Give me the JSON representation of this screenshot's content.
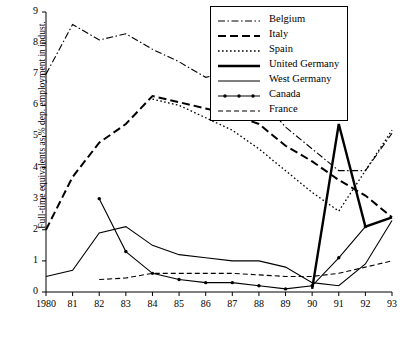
{
  "chart_data": {
    "type": "line",
    "title": "",
    "xlabel": "",
    "ylabel": "Full-time equivalents as % dep. employment in indust.",
    "x": [
      "1980",
      "81",
      "82",
      "83",
      "84",
      "85",
      "86",
      "87",
      "88",
      "89",
      "90",
      "91",
      "92",
      "93"
    ],
    "xtick_labels": [
      "1980",
      "81",
      "82",
      "83",
      "84",
      "85",
      "86",
      "87",
      "88",
      "89",
      "90",
      "91",
      "92",
      "93"
    ],
    "ytick_labels": [
      "0",
      "1",
      "2",
      "3",
      "4",
      "5",
      "6",
      "7",
      "8",
      "9"
    ],
    "ylim": [
      0,
      9
    ],
    "xlim": [
      1980,
      1993
    ],
    "grid": false,
    "legend_position": "top-right",
    "series": [
      {
        "name": "Belgium",
        "style": "dash-dot",
        "values": [
          7.0,
          8.6,
          8.1,
          8.3,
          7.8,
          7.4,
          6.9,
          7.1,
          6.3,
          5.3,
          4.6,
          3.9,
          3.9,
          5.1
        ]
      },
      {
        "name": "Italy",
        "style": "dashed-thick",
        "values": [
          2.0,
          3.7,
          4.8,
          5.4,
          6.3,
          6.1,
          5.9,
          5.7,
          5.4,
          4.7,
          4.2,
          3.6,
          3.1,
          2.4
        ]
      },
      {
        "name": "Spain",
        "style": "dotted",
        "values": [
          null,
          null,
          null,
          null,
          6.2,
          6.0,
          5.6,
          5.2,
          4.6,
          3.9,
          3.2,
          2.6,
          3.9,
          5.2
        ]
      },
      {
        "name": "United Germany",
        "style": "solid-thick",
        "values": [
          null,
          null,
          null,
          null,
          null,
          null,
          null,
          null,
          null,
          null,
          0.1,
          5.4,
          2.1,
          2.4
        ]
      },
      {
        "name": "West Germany",
        "style": "solid-thin",
        "values": [
          0.5,
          0.7,
          1.9,
          2.1,
          1.5,
          1.2,
          1.1,
          1.0,
          1.0,
          0.8,
          0.3,
          0.2,
          0.9,
          2.3
        ]
      },
      {
        "name": "Canada",
        "style": "solid-thin-marked",
        "values": [
          null,
          null,
          3.0,
          1.3,
          0.6,
          0.4,
          0.3,
          0.3,
          0.2,
          0.1,
          0.2,
          1.1,
          2.1,
          null
        ]
      },
      {
        "name": "France",
        "style": "dashed-thin",
        "values": [
          null,
          null,
          0.4,
          0.45,
          0.6,
          0.6,
          0.6,
          0.6,
          0.55,
          0.5,
          0.5,
          0.6,
          0.8,
          1.0
        ]
      }
    ]
  },
  "legend": {
    "items": [
      {
        "label": "Belgium"
      },
      {
        "label": "Italy"
      },
      {
        "label": "Spain"
      },
      {
        "label": "United Germany"
      },
      {
        "label": "West Germany"
      },
      {
        "label": "Canada"
      },
      {
        "label": "France"
      }
    ]
  }
}
